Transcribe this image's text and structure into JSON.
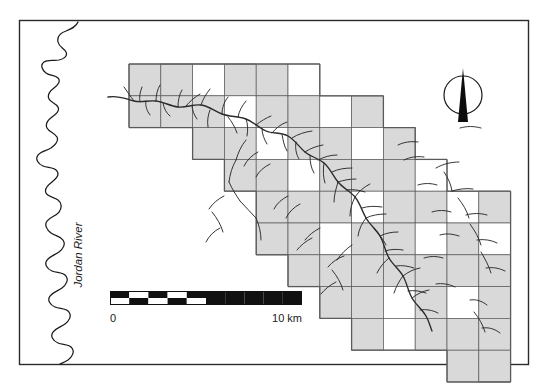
{
  "figure": {
    "type": "map",
    "title": "",
    "background_color": "#ffffff",
    "frame": {
      "name": "map-frame",
      "x": 19,
      "y": 20,
      "width": 510,
      "height": 345,
      "stroke": "#2b2b2b",
      "stroke_width": 1.4,
      "fill": "#ffffff"
    }
  },
  "labels": {
    "river_label": "Jordan River",
    "scale_zero": "0",
    "scale_max": "10 km",
    "north_letter": ""
  },
  "colors": {
    "tile_fill": "#d9d9d9",
    "tile_stroke": "#5a5a5a",
    "hole_fill": "#ffffff",
    "stream_stroke": "#2a2a2a",
    "river_stroke": "#1a1a1a",
    "frame_stroke": "#2b2b2b",
    "scale_dark": "#111111",
    "scale_light": "#ffffff",
    "text_color": "#1a1a1a"
  },
  "scale_bar": {
    "name": "scale-bar",
    "x": 110,
    "y": 291,
    "width": 192,
    "height": 14,
    "segments": 10,
    "rows": 2,
    "solid_from_segment": 5,
    "left_label": "0",
    "right_label": "10 km",
    "units": "km",
    "max_value": 10
  },
  "north_arrow": {
    "name": "north-arrow",
    "circle_cx": 463,
    "circle_cy": 95,
    "circle_r": 19,
    "needle_top_y": 68,
    "needle_bottom_y": 122,
    "needle_half_width": 5
  },
  "chart_data": {
    "type": "map",
    "tile_grid": {
      "origin_x": 129,
      "origin_y": 64,
      "cell": 31.8,
      "note": "tiles listed as [col,row] index pairs relative to origin; white tiles are unsurveyed holes"
    },
    "tiles_filled": [
      [
        0,
        0
      ],
      [
        1,
        0
      ],
      [
        2,
        0
      ],
      [
        3,
        0
      ],
      [
        4,
        0
      ],
      [
        5,
        0
      ],
      [
        0,
        1
      ],
      [
        1,
        1
      ],
      [
        2,
        1
      ],
      [
        3,
        1
      ],
      [
        4,
        1
      ],
      [
        5,
        1
      ],
      [
        6,
        1
      ],
      [
        7,
        1
      ],
      [
        2,
        2
      ],
      [
        3,
        2
      ],
      [
        4,
        2
      ],
      [
        5,
        2
      ],
      [
        6,
        2
      ],
      [
        7,
        2
      ],
      [
        8,
        2
      ],
      [
        3,
        3
      ],
      [
        4,
        3
      ],
      [
        5,
        3
      ],
      [
        6,
        3
      ],
      [
        7,
        3
      ],
      [
        8,
        3
      ],
      [
        9,
        3
      ],
      [
        4,
        4
      ],
      [
        5,
        4
      ],
      [
        6,
        4
      ],
      [
        7,
        4
      ],
      [
        8,
        4
      ],
      [
        9,
        4
      ],
      [
        10,
        4
      ],
      [
        11,
        4
      ],
      [
        4,
        5
      ],
      [
        5,
        5
      ],
      [
        6,
        5
      ],
      [
        7,
        5
      ],
      [
        8,
        5
      ],
      [
        9,
        5
      ],
      [
        10,
        5
      ],
      [
        11,
        5
      ],
      [
        5,
        6
      ],
      [
        6,
        6
      ],
      [
        7,
        6
      ],
      [
        8,
        6
      ],
      [
        9,
        6
      ],
      [
        10,
        6
      ],
      [
        11,
        6
      ],
      [
        6,
        7
      ],
      [
        7,
        7
      ],
      [
        8,
        7
      ],
      [
        9,
        7
      ],
      [
        10,
        7
      ],
      [
        11,
        7
      ],
      [
        7,
        8
      ],
      [
        8,
        8
      ],
      [
        9,
        8
      ],
      [
        10,
        8
      ],
      [
        11,
        8
      ],
      [
        10,
        9
      ],
      [
        11,
        9
      ]
    ],
    "tiles_hole": [
      [
        2,
        0
      ],
      [
        5,
        0
      ],
      [
        3,
        1
      ],
      [
        6,
        1
      ],
      [
        4,
        2
      ],
      [
        7,
        2
      ],
      [
        5,
        3
      ],
      [
        9,
        3
      ],
      [
        7,
        4
      ],
      [
        10,
        4
      ],
      [
        6,
        5
      ],
      [
        9,
        5
      ],
      [
        11,
        5
      ],
      [
        8,
        7
      ],
      [
        10,
        7
      ],
      [
        8,
        8
      ]
    ],
    "legend": [],
    "annotations": [
      {
        "text": "Jordan River",
        "x": 82,
        "y": 255,
        "rotation": -90,
        "style": "italic"
      },
      {
        "text": "0",
        "x": 110,
        "y": 320,
        "rotation": 0,
        "style": "normal"
      },
      {
        "text": "10 km",
        "x": 291,
        "y": 320,
        "rotation": 0,
        "style": "normal"
      }
    ]
  }
}
